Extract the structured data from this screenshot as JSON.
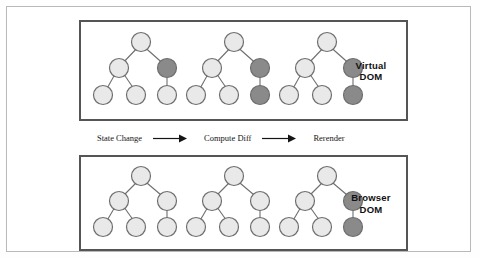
{
  "figure": {
    "panels": [
      {
        "id": "virtual-dom",
        "label_line1": "Virtual",
        "label_line2": "DOM",
        "trees": [
          {
            "name": "tree-1",
            "nodes": {
              "root": "light",
              "left": "light",
              "right": "dark",
              "leaf_left": "light",
              "leaf_mid": "light",
              "leaf_right": "light"
            }
          },
          {
            "name": "tree-2",
            "nodes": {
              "root": "light",
              "left": "light",
              "right": "dark",
              "leaf_left": "light",
              "leaf_mid": "light",
              "leaf_right": "dark"
            }
          },
          {
            "name": "tree-3",
            "nodes": {
              "root": "light",
              "left": "light",
              "right": "dark",
              "leaf_left": "light",
              "leaf_mid": "light",
              "leaf_right": "dark"
            }
          }
        ]
      },
      {
        "id": "browser-dom",
        "label_line1": "Browser",
        "label_line2": "DOM",
        "trees": [
          {
            "name": "tree-1",
            "nodes": {
              "root": "light",
              "left": "light",
              "right": "light",
              "leaf_left": "light",
              "leaf_mid": "light",
              "leaf_right": "light"
            }
          },
          {
            "name": "tree-2",
            "nodes": {
              "root": "light",
              "left": "light",
              "right": "light",
              "leaf_left": "light",
              "leaf_mid": "light",
              "leaf_right": "light"
            }
          },
          {
            "name": "tree-3",
            "nodes": {
              "root": "light",
              "left": "light",
              "right": "dark",
              "leaf_left": "light",
              "leaf_mid": "light",
              "leaf_right": "dark"
            }
          }
        ]
      }
    ],
    "flow": {
      "step1": "State Change",
      "step2": "Compute Diff",
      "step3": "Rerender",
      "arrow1": "arrow-right-icon",
      "arrow2": "arrow-right-icon"
    },
    "colors": {
      "node_light_fill": "#e9e9e9",
      "node_dark_fill": "#8a8a8a",
      "node_stroke": "#6e6e6e",
      "edge": "#6e6e6e",
      "panel_border": "#555555",
      "outer_border": "#b9b9b9",
      "text": "#111111",
      "background": "#ffffff"
    }
  }
}
